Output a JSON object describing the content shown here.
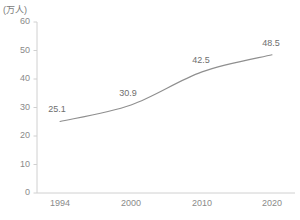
{
  "chart_data": {
    "type": "line",
    "title": "",
    "xlabel": "",
    "ylabel": "",
    "unit_label": "(万人)",
    "categories": [
      "1994",
      "2000",
      "2010",
      "2020"
    ],
    "x": [
      1994,
      2000,
      2010,
      2020
    ],
    "values": [
      25.1,
      30.9,
      42.5,
      48.5
    ],
    "point_labels": [
      "25.1",
      "30.9",
      "42.5",
      "48.5"
    ],
    "ylim": [
      0,
      60
    ],
    "yticks": [
      0,
      10,
      20,
      30,
      40,
      50,
      60
    ],
    "ytick_labels": [
      "0",
      "10",
      "20",
      "30",
      "40",
      "50",
      "60"
    ],
    "xtick_labels": [
      "1994",
      "2000",
      "2010",
      "2020"
    ],
    "grid": false,
    "legend": false,
    "legend_position": "none",
    "series": [
      {
        "name": "",
        "values": [
          25.1,
          30.9,
          42.5,
          48.5
        ],
        "color": "#8f8f8f"
      }
    ],
    "colors": {
      "line": "#8f8f8f",
      "axis": "#d0d0d0",
      "tick_text": "#8a8a8a",
      "label_text": "#6e6e6e",
      "background": "#ffffff"
    }
  }
}
